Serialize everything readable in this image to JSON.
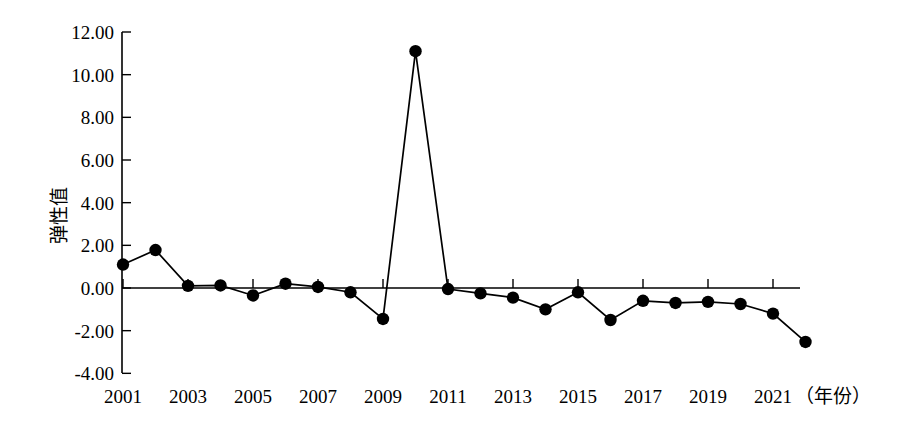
{
  "chart_data": {
    "type": "line",
    "title": "",
    "subtitle": "",
    "xlabel": "（年份）",
    "ylabel": "弹性值",
    "x": [
      2001,
      2002,
      2003,
      2004,
      2005,
      2006,
      2007,
      2008,
      2009,
      2010,
      2011,
      2012,
      2013,
      2014,
      2015,
      2016,
      2017,
      2018,
      2019,
      2020,
      2021,
      2022
    ],
    "values": [
      1.1,
      1.78,
      0.1,
      0.12,
      -0.35,
      0.2,
      0.05,
      -0.2,
      -1.45,
      11.1,
      -0.05,
      -0.25,
      -0.45,
      -1.0,
      -0.2,
      -1.5,
      -0.6,
      -0.7,
      -0.65,
      -0.75,
      -1.2,
      -2.53
    ],
    "series": [
      {
        "name": "弹性值",
        "values": [
          1.1,
          1.78,
          0.1,
          0.12,
          -0.35,
          0.2,
          0.05,
          -0.2,
          -1.45,
          11.1,
          -0.05,
          -0.25,
          -0.45,
          -1.0,
          -0.2,
          -1.5,
          -0.6,
          -0.7,
          -0.65,
          -0.75,
          -1.2,
          -2.53
        ]
      }
    ],
    "xlim": [
      2001,
      2022
    ],
    "ylim": [
      -4.0,
      12.0
    ],
    "y_ticks": [
      -4.0,
      -2.0,
      0.0,
      2.0,
      4.0,
      6.0,
      8.0,
      10.0,
      12.0
    ],
    "y_tick_labels": [
      "-4.00",
      "-2.00",
      "0.00",
      "2.00",
      "4.00",
      "6.00",
      "8.00",
      "10.00",
      "12.00"
    ],
    "x_ticks": [
      2001,
      2003,
      2005,
      2007,
      2009,
      2011,
      2013,
      2015,
      2017,
      2019,
      2021
    ],
    "x_tick_labels": [
      "2001",
      "2003",
      "2005",
      "2007",
      "2009",
      "2011",
      "2013",
      "2015",
      "2017",
      "2019",
      "2021"
    ],
    "grid": false,
    "legend": false,
    "legend_position": "none",
    "marker": "filled-circle",
    "marker_color": "#000000",
    "line_color": "#000000",
    "background_color": "#ffffff",
    "annotations": [
      {
        "text": "（年份）",
        "role": "x-axis-unit",
        "position": "axis-end-right"
      }
    ]
  }
}
